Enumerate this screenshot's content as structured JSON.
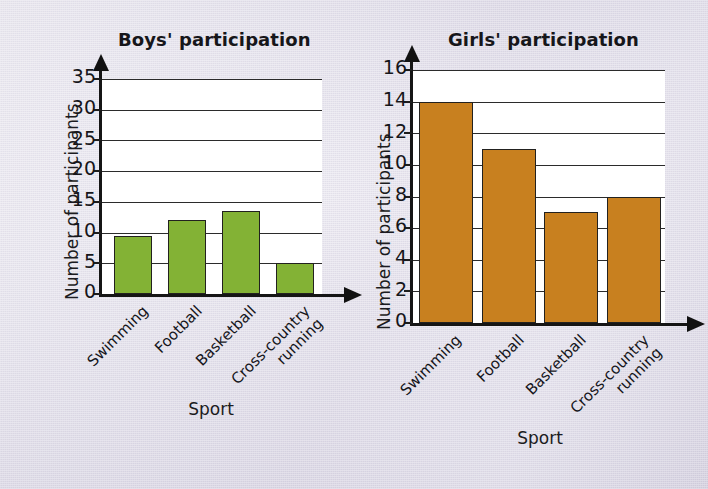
{
  "background_color": "#e3e0ea",
  "charts": [
    {
      "id": "boys",
      "title": "Boys' participation",
      "ylabel": "Number of participants",
      "xlabel": "Sport",
      "bar_color": "#83b235",
      "chart_data": {
        "type": "bar",
        "title": "Boys' participation",
        "xlabel": "Sport",
        "ylabel": "Number of participants",
        "categories": [
          "Swimming",
          "Football",
          "Basketball",
          "Cross-country running"
        ],
        "values": [
          9.5,
          12,
          13.5,
          5
        ],
        "ylim": [
          0,
          35
        ],
        "ytick_step": 5,
        "yticks": [
          "0",
          "5",
          "10",
          "15",
          "20",
          "25",
          "30",
          "35"
        ],
        "grid": true,
        "legend": "none",
        "bar_color": "#83b235"
      }
    },
    {
      "id": "girls",
      "title": "Girls' participation",
      "ylabel": "Number of participants",
      "xlabel": "Sport",
      "bar_color": "#c8801f",
      "chart_data": {
        "type": "bar",
        "title": "Girls' participation",
        "xlabel": "Sport",
        "ylabel": "Number of participants",
        "categories": [
          "Swimming",
          "Football",
          "Basketball",
          "Cross-country running"
        ],
        "values": [
          14,
          11,
          7,
          8
        ],
        "ylim": [
          0,
          16
        ],
        "ytick_step": 2,
        "yticks": [
          "0",
          "2",
          "4",
          "6",
          "8",
          "10",
          "12",
          "14",
          "16"
        ],
        "grid": true,
        "legend": "none",
        "bar_color": "#c8801f"
      }
    }
  ],
  "category_labels_split": [
    {
      "line1": "Swimming",
      "line2": ""
    },
    {
      "line1": "Football",
      "line2": ""
    },
    {
      "line1": "Basketball",
      "line2": ""
    },
    {
      "line1": "Cross-country",
      "line2": "running"
    }
  ]
}
